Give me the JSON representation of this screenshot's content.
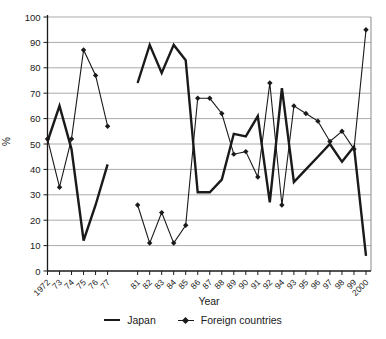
{
  "chart_data": {
    "type": "line",
    "title": "",
    "xlabel": "Year",
    "ylabel": "%",
    "ylim": [
      0,
      100
    ],
    "y_ticks": [
      0,
      10,
      20,
      30,
      40,
      50,
      60,
      70,
      80,
      90,
      100
    ],
    "categories": [
      "1972",
      "73",
      "74",
      "75",
      "76",
      "77",
      "81",
      "82",
      "83",
      "84",
      "85",
      "86",
      "87",
      "88",
      "89",
      "90",
      "91",
      "92",
      "94",
      "93",
      "95",
      "96",
      "97",
      "98",
      "99",
      "2000"
    ],
    "axis_break_after_index": 5,
    "axis_break_extra_slots": 1.5,
    "grid": "horizontal",
    "legend_position": "bottom",
    "colors": {
      "line": "#1a1a1a",
      "grid": "#aaaaaa",
      "background": "#ffffff"
    },
    "series": [
      {
        "name": "Japan",
        "marker": "none",
        "values": [
          51,
          65,
          48,
          12,
          26,
          42,
          74,
          89,
          78,
          89,
          83,
          31,
          31,
          36,
          54,
          53,
          61,
          27,
          72,
          35,
          40,
          45,
          50,
          43,
          49,
          6
        ]
      },
      {
        "name": "Foreign countries",
        "marker": "diamond",
        "values": [
          52,
          33,
          52,
          87,
          77,
          57,
          26,
          11,
          23,
          11,
          18,
          68,
          68,
          62,
          46,
          47,
          37,
          74,
          26,
          65,
          62,
          59,
          51,
          55,
          48,
          95
        ]
      }
    ]
  }
}
